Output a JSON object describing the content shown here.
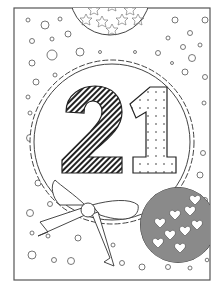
{
  "artwork": {
    "type": "coloring-page",
    "subject": "21st birthday",
    "number_text": "21",
    "frame_color": "#555555",
    "line_color": "#333333",
    "background_color": "#ffffff",
    "elements": [
      {
        "name": "star-balloon",
        "pattern": "stars",
        "position": "top-center"
      },
      {
        "name": "scalloped-circle-badge",
        "position": "center"
      },
      {
        "name": "digit-2",
        "pattern": "diagonal-stripes"
      },
      {
        "name": "digit-1",
        "pattern": "dots"
      },
      {
        "name": "ribbon-bow",
        "position": "bottom-left"
      },
      {
        "name": "heart-balloon",
        "pattern": "hearts",
        "fill": "#8a8a8a",
        "position": "bottom-right"
      },
      {
        "name": "confetti-bubbles",
        "pattern": "circles",
        "position": "scattered"
      }
    ]
  }
}
